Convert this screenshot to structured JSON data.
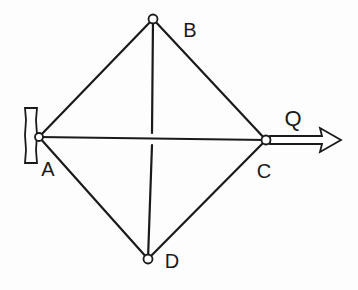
{
  "diagram": {
    "type": "truss",
    "colors": {
      "line": "#1a1a1a",
      "background": "#fdfdfd",
      "joint_fill": "#ffffff"
    },
    "joints": [
      {
        "id": "A",
        "label": "A",
        "x": 39,
        "y": 137,
        "label_x": 48,
        "label_y": 169
      },
      {
        "id": "B",
        "label": "B",
        "x": 153,
        "y": 19,
        "label_x": 190,
        "label_y": 30
      },
      {
        "id": "C",
        "label": "C",
        "x": 266,
        "y": 140,
        "label_x": 264,
        "label_y": 171
      },
      {
        "id": "D",
        "label": "D",
        "x": 148,
        "y": 259,
        "label_x": 172,
        "label_y": 261
      }
    ],
    "members": [
      {
        "from": "A",
        "to": "B"
      },
      {
        "from": "B",
        "to": "C"
      },
      {
        "from": "C",
        "to": "D"
      },
      {
        "from": "D",
        "to": "A"
      },
      {
        "from": "A",
        "to": "C"
      },
      {
        "from": "B",
        "to": "D"
      }
    ],
    "support": {
      "at": "A",
      "type": "wall",
      "x": 25,
      "y": 108,
      "width": 12,
      "height": 55
    },
    "force": {
      "label": "Q",
      "at": "C",
      "direction": "right",
      "label_x": 293,
      "label_y": 119,
      "tip_x": 341
    }
  },
  "labels": {
    "A": "A",
    "B": "B",
    "C": "C",
    "D": "D",
    "Q": "Q"
  }
}
